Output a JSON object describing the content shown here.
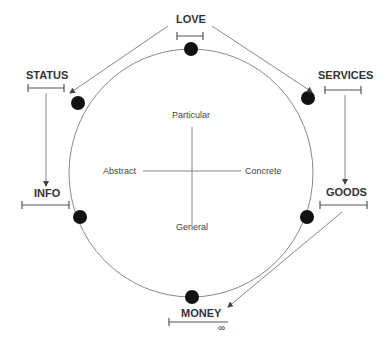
{
  "diagram": {
    "resources": [
      {
        "key": "love",
        "label": "LOVE"
      },
      {
        "key": "services",
        "label": "SERVICES"
      },
      {
        "key": "goods",
        "label": "GOODS"
      },
      {
        "key": "money",
        "label": "MONEY",
        "range_end": "∞"
      },
      {
        "key": "info",
        "label": "INFO"
      },
      {
        "key": "status",
        "label": "STATUS"
      }
    ],
    "axes": {
      "top": "Particular",
      "bottom": "General",
      "left": "Abstract",
      "right": "Concrete"
    },
    "colors": {
      "line": "#777777",
      "dot": "#111111",
      "text": "#333333"
    }
  }
}
